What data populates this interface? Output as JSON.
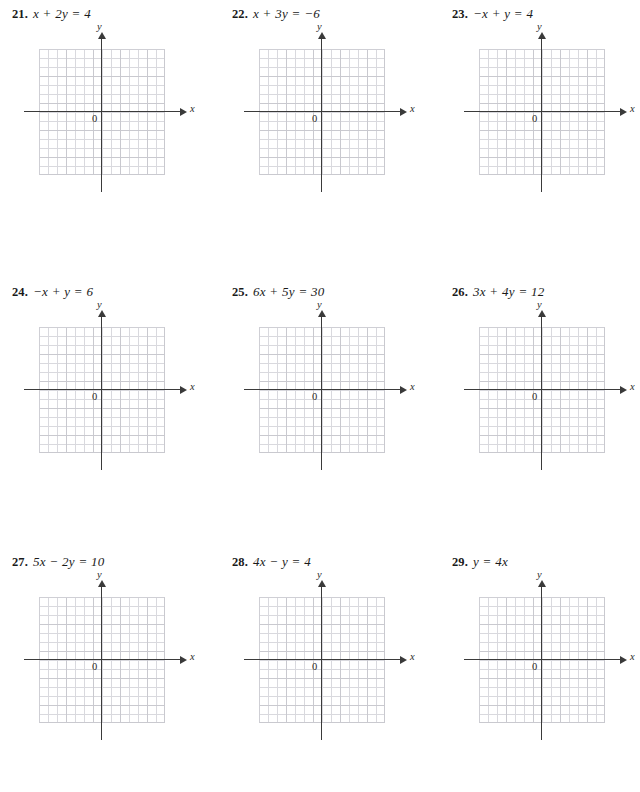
{
  "page": {
    "width": 633,
    "height": 792,
    "background_color": "#ffffff",
    "axis_color": "#3a3a3a",
    "grid_major_color": "#c9c9cf",
    "grid_minor_color": "#d9d9de"
  },
  "graph_defaults": {
    "x_axis_label": "x",
    "y_axis_label": "y",
    "origin_label": "0",
    "grid_cells_x": 14,
    "grid_cells_y": 14,
    "major_every": 3
  },
  "problems": [
    {
      "number": "21.",
      "equation": "x + 2y = 4",
      "column": 0,
      "row": 0,
      "chart_data": {
        "type": "line",
        "title": "x + 2y = 4",
        "xlabel": "x",
        "ylabel": "y",
        "origin_label": "0",
        "xlim": [
          -7,
          7
        ],
        "ylim": [
          -7,
          7
        ],
        "grid": true,
        "minor_step": 1,
        "major_step": 3,
        "legend": "none",
        "series": []
      }
    },
    {
      "number": "22.",
      "equation": "x + 3y = −6",
      "column": 1,
      "row": 0,
      "chart_data": {
        "type": "line",
        "title": "x + 3y = −6",
        "xlabel": "x",
        "ylabel": "y",
        "origin_label": "0",
        "xlim": [
          -7,
          7
        ],
        "ylim": [
          -7,
          7
        ],
        "grid": true,
        "minor_step": 1,
        "major_step": 3,
        "legend": "none",
        "series": []
      }
    },
    {
      "number": "23.",
      "equation": "−x + y = 4",
      "column": 2,
      "row": 0,
      "chart_data": {
        "type": "line",
        "title": "−x + y = 4",
        "xlabel": "x",
        "ylabel": "y",
        "origin_label": "0",
        "xlim": [
          -7,
          7
        ],
        "ylim": [
          -7,
          7
        ],
        "grid": true,
        "minor_step": 1,
        "major_step": 3,
        "legend": "none",
        "series": []
      }
    },
    {
      "number": "24.",
      "equation": "−x + y = 6",
      "column": 0,
      "row": 1,
      "chart_data": {
        "type": "line",
        "title": "−x + y = 6",
        "xlabel": "x",
        "ylabel": "y",
        "origin_label": "0",
        "xlim": [
          -7,
          7
        ],
        "ylim": [
          -7,
          7
        ],
        "grid": true,
        "minor_step": 1,
        "major_step": 3,
        "legend": "none",
        "series": []
      }
    },
    {
      "number": "25.",
      "equation": "6x + 5y = 30",
      "column": 1,
      "row": 1,
      "chart_data": {
        "type": "line",
        "title": "6x + 5y = 30",
        "xlabel": "x",
        "ylabel": "y",
        "origin_label": "0",
        "xlim": [
          -7,
          7
        ],
        "ylim": [
          -7,
          7
        ],
        "grid": true,
        "minor_step": 1,
        "major_step": 3,
        "legend": "none",
        "series": []
      }
    },
    {
      "number": "26.",
      "equation": "3x + 4y = 12",
      "column": 2,
      "row": 1,
      "chart_data": {
        "type": "line",
        "title": "3x + 4y = 12",
        "xlabel": "x",
        "ylabel": "y",
        "origin_label": "0",
        "xlim": [
          -7,
          7
        ],
        "ylim": [
          -7,
          7
        ],
        "grid": true,
        "minor_step": 1,
        "major_step": 3,
        "legend": "none",
        "series": []
      }
    },
    {
      "number": "27.",
      "equation": "5x − 2y = 10",
      "column": 0,
      "row": 2,
      "chart_data": {
        "type": "line",
        "title": "5x − 2y = 10",
        "xlabel": "x",
        "ylabel": "y",
        "origin_label": "0",
        "xlim": [
          -7,
          7
        ],
        "ylim": [
          -7,
          7
        ],
        "grid": true,
        "minor_step": 1,
        "major_step": 3,
        "legend": "none",
        "series": []
      }
    },
    {
      "number": "28.",
      "equation": "4x − y = 4",
      "column": 1,
      "row": 2,
      "chart_data": {
        "type": "line",
        "title": "4x − y = 4",
        "xlabel": "x",
        "ylabel": "y",
        "origin_label": "0",
        "xlim": [
          -7,
          7
        ],
        "ylim": [
          -7,
          7
        ],
        "grid": true,
        "minor_step": 1,
        "major_step": 3,
        "legend": "none",
        "series": []
      }
    },
    {
      "number": "29.",
      "equation": "y = 4x",
      "column": 2,
      "row": 2,
      "chart_data": {
        "type": "line",
        "title": "y = 4x",
        "xlabel": "x",
        "ylabel": "y",
        "origin_label": "0",
        "xlim": [
          -7,
          7
        ],
        "ylim": [
          -7,
          7
        ],
        "grid": true,
        "minor_step": 1,
        "major_step": 3,
        "legend": "none",
        "series": []
      }
    }
  ]
}
